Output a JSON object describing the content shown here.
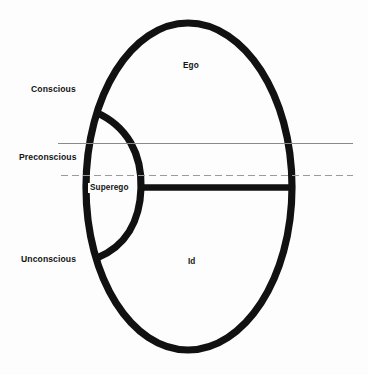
{
  "diagram": {
    "type": "structural-topographic-diagram",
    "background_color": "#fdfdfd",
    "stroke_color": "#111111",
    "thin_line_color": "#888888",
    "regions": [
      {
        "key": "conscious",
        "label": "Conscious"
      },
      {
        "key": "preconscious",
        "label": "Preconscious"
      },
      {
        "key": "unconscious",
        "label": "Unconscious"
      }
    ],
    "structures": [
      {
        "key": "ego",
        "label": "Ego"
      },
      {
        "key": "superego",
        "label": "Superego"
      },
      {
        "key": "id",
        "label": "Id"
      }
    ],
    "dividers": [
      {
        "key": "conscious-preconscious-boundary",
        "style": "solid",
        "y": 143
      },
      {
        "key": "preconscious-unconscious-boundary",
        "style": "dashed",
        "y": 175
      },
      {
        "key": "ego-id-boundary",
        "style": "thick-solid",
        "y": 187
      }
    ]
  }
}
